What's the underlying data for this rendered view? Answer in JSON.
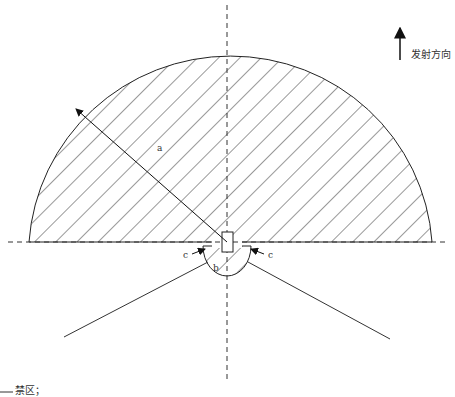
{
  "diagram": {
    "direction_label": "发射方向",
    "legend": {
      "forbidden_zone_label": "禁区；"
    },
    "labels": {
      "radius": "a",
      "inner_region": "b",
      "gap_left": "c",
      "gap_right": "c"
    },
    "geometry": {
      "center": [
        227,
        242
      ],
      "outer_radius": 202,
      "inner_radius": 24,
      "baseline_y": 242,
      "hatch_color": "#333333",
      "line_color": "#222222"
    }
  }
}
